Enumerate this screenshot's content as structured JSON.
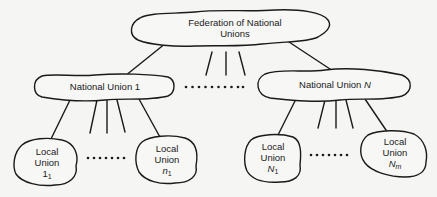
{
  "diagram": {
    "type": "hierarchy",
    "root": {
      "line1": "Federation of National",
      "line2": "Unions"
    },
    "national_unions": [
      {
        "label_prefix": "National Union ",
        "label_var": "1"
      },
      {
        "label_prefix": "National Union ",
        "label_var": "N"
      }
    ],
    "local_unions": [
      {
        "line1": "Local",
        "line2": "Union",
        "var": "1",
        "sub": "1",
        "parent": "National Union 1"
      },
      {
        "line1": "Local",
        "line2": "Union",
        "var": "n",
        "sub": "1",
        "parent": "National Union 1"
      },
      {
        "line1": "Local",
        "line2": "Union",
        "var": "N",
        "sub": "1",
        "parent": "National Union N"
      },
      {
        "line1": "Local",
        "line2": "Union",
        "var": "N",
        "sub": "m",
        "parent": "National Union N"
      }
    ],
    "ellipsis": "••••••••••",
    "ellipsis_short": "•••••••",
    "colors": {
      "stroke": "#1a1a1a",
      "background": "#f5f5f3",
      "fill": "#f7f7f5"
    }
  }
}
